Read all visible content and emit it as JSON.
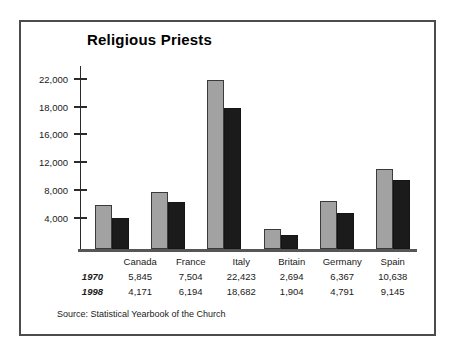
{
  "figure": {
    "title": "Religious Priests",
    "source_note": "Source: Statistical Yearbook of the Church",
    "frame_color": "#4c4c4c",
    "background": "#ffffff"
  },
  "chart_data": {
    "type": "bar",
    "title": "Religious Priests",
    "xlabel": "",
    "ylabel": "",
    "grid": false,
    "legend": "none",
    "categories": [
      "Canada",
      "France",
      "Italy",
      "Britain",
      "Germany",
      "Spain"
    ],
    "ytick_labels": [
      "22,000",
      "18,000",
      "16,000",
      "12,000",
      "8,000",
      "4,000"
    ],
    "ytick_values": [
      22000,
      18000,
      16000,
      12000,
      8000,
      4000
    ],
    "ylim": [
      0,
      24000
    ],
    "series": [
      {
        "name": "1970",
        "color": "#a2a2a2",
        "values": [
          5845,
          7504,
          22423,
          2694,
          6367,
          10638
        ],
        "labels": [
          "5,845",
          "7,504",
          "22,423",
          "2,694",
          "6,367",
          "10,638"
        ]
      },
      {
        "name": "1998",
        "color": "#1b1b1b",
        "values": [
          4171,
          6194,
          18682,
          1904,
          4791,
          9145
        ],
        "labels": [
          "4,171",
          "6,194",
          "18,682",
          "1,904",
          "4,791",
          "9,145"
        ]
      }
    ]
  }
}
